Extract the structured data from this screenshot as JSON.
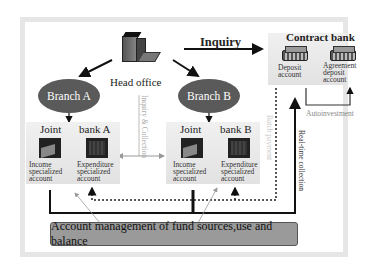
{
  "diagram": {
    "head_office": {
      "label": "Head office",
      "icon": "office-building-icon"
    },
    "inquiry": {
      "label": "Inquiry"
    },
    "contract_bank": {
      "title": "Contract bank",
      "accounts": [
        {
          "label_lines": [
            "Deposit",
            "account"
          ],
          "icon": "server-icon"
        },
        {
          "label_lines": [
            "Agreement",
            "deposit",
            "account"
          ],
          "icon": "server-icon"
        }
      ],
      "autoinvestment": "Autoinvestment"
    },
    "branches": [
      {
        "name": "Branch A",
        "joint_label": "Joint",
        "bank_label": "bank A",
        "accounts": [
          {
            "label_lines": [
              "Income",
              "specialized",
              "account"
            ]
          },
          {
            "label_lines": [
              "Expenditure",
              "specialized",
              "account"
            ]
          }
        ]
      },
      {
        "name": "Branch B",
        "joint_label": "Joint",
        "bank_label": "bank B",
        "accounts": [
          {
            "label_lines": [
              "Income",
              "specialized",
              "account"
            ]
          },
          {
            "label_lines": [
              "Expenditure",
              "specialized",
              "account"
            ]
          }
        ]
      }
    ],
    "vertical_labels": {
      "inquiry_collection": "Inquiry & Collection",
      "batch_payment": "Batch payment",
      "realtime_collection": "Real-time collection"
    },
    "footer": {
      "label": "Account management of fund sources,use and balance"
    }
  }
}
